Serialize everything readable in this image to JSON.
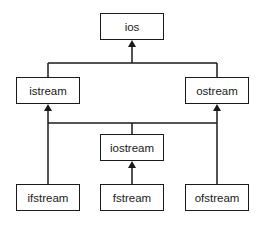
{
  "diagram": {
    "type": "class-hierarchy",
    "nodes": {
      "ios": "ios",
      "istream": "istream",
      "ostream": "ostream",
      "iostream": "iostream",
      "ifstream": "ifstream",
      "fstream": "fstream",
      "ofstream": "ofstream"
    },
    "edges": [
      {
        "from": "istream",
        "to": "ios"
      },
      {
        "from": "ostream",
        "to": "ios"
      },
      {
        "from": "iostream",
        "to": "istream"
      },
      {
        "from": "iostream",
        "to": "ostream"
      },
      {
        "from": "ifstream",
        "to": "istream"
      },
      {
        "from": "ofstream",
        "to": "ostream"
      },
      {
        "from": "fstream",
        "to": "iostream"
      }
    ],
    "colors": {
      "line": "#1a1a1a",
      "background": "#ffffff"
    }
  }
}
